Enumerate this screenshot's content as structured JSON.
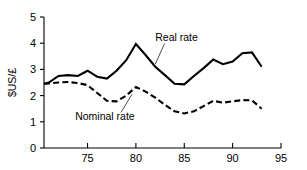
{
  "chart_data": {
    "type": "line",
    "title": "",
    "subtitle": "",
    "xlabel": "",
    "ylabel": "$US/£",
    "xlim": [
      70.5,
      95
    ],
    "ylim": [
      0,
      5
    ],
    "grid": false,
    "legend_position": "inline-annotations",
    "x_ticks": [
      "75",
      "80",
      "85",
      "90",
      "95"
    ],
    "x_tick_values": [
      75,
      80,
      85,
      90,
      95
    ],
    "y_ticks": [
      "0",
      "1",
      "2",
      "3",
      "4",
      "5"
    ],
    "y_tick_values": [
      0,
      1,
      2,
      3,
      4,
      5
    ],
    "x": [
      70.5,
      71,
      72,
      73,
      74,
      75,
      76,
      77,
      78,
      79,
      80,
      81,
      82,
      83,
      84,
      85,
      86,
      87,
      88,
      89,
      90,
      91,
      92,
      93
    ],
    "series": [
      {
        "name": "Real rate",
        "style": "solid",
        "values": [
          2.45,
          2.5,
          2.75,
          2.78,
          2.75,
          2.95,
          2.72,
          2.65,
          2.95,
          3.35,
          3.97,
          3.55,
          3.1,
          2.78,
          2.45,
          2.43,
          2.75,
          3.05,
          3.38,
          3.2,
          3.3,
          3.62,
          3.65,
          3.1
        ]
      },
      {
        "name": "Nominal rate",
        "style": "dashed",
        "values": [
          2.45,
          2.46,
          2.5,
          2.52,
          2.48,
          2.4,
          2.1,
          1.8,
          1.78,
          2.0,
          2.33,
          2.15,
          1.92,
          1.65,
          1.4,
          1.32,
          1.4,
          1.6,
          1.8,
          1.73,
          1.78,
          1.83,
          1.82,
          1.5
        ]
      }
    ],
    "annotations": [
      {
        "text": "Real rate",
        "x": 84.2,
        "y": 4.1,
        "points_to_x": 82.0,
        "points_to_y": 3.2
      },
      {
        "text": "Nominal rate",
        "x": 76.8,
        "y": 1.05,
        "points_to_x": 79.6,
        "points_to_y": 2.05
      }
    ]
  },
  "axis": {
    "y_title": "$US/£"
  }
}
